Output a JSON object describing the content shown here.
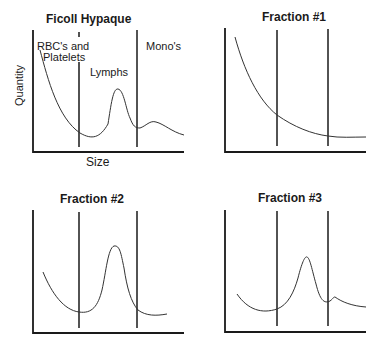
{
  "panels": [
    {
      "title": "Ficoll Hypaque",
      "region_labels": [
        "RBC's and",
        "Platelets",
        "Lymphs",
        "Mono's"
      ],
      "xlabel": "Size",
      "ylabel": "Quantity"
    },
    {
      "title": "Fraction #1"
    },
    {
      "title": "Fraction #2"
    },
    {
      "title": "Fraction #3"
    }
  ]
}
